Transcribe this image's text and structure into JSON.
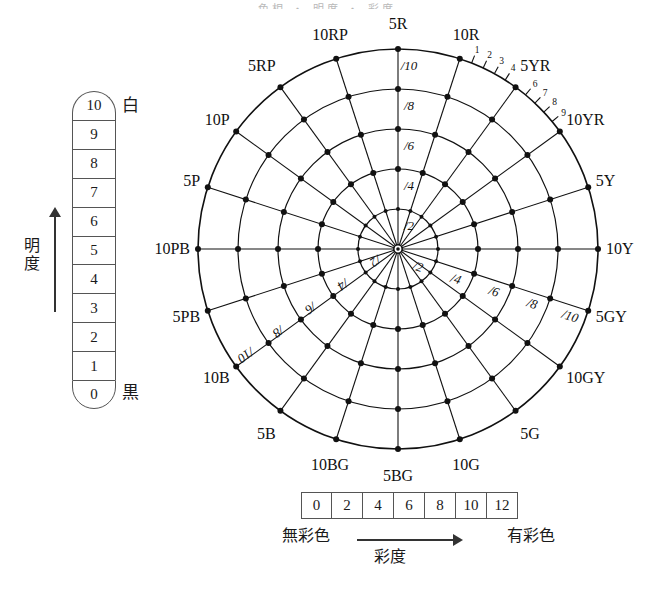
{
  "title_remnant": "色相 ・ 明度 ・ 彩度",
  "value_scale": {
    "axis_label": "明度",
    "top_label": "白",
    "bottom_label": "黒",
    "steps": [
      "10",
      "9",
      "8",
      "7",
      "6",
      "5",
      "4",
      "3",
      "2",
      "1",
      "0"
    ]
  },
  "chroma_scale": {
    "axis_label": "彩度",
    "left_label": "無彩色",
    "right_label": "有彩色",
    "steps": [
      "0",
      "2",
      "4",
      "6",
      "8",
      "10",
      "12"
    ]
  },
  "hue_circle": {
    "center": {
      "x": 398,
      "y": 249
    },
    "outer_radius": 200,
    "ring_count": 5,
    "hues": [
      {
        "label": "5R",
        "angle": -90
      },
      {
        "label": "10R",
        "angle": -72
      },
      {
        "label": "5YR",
        "angle": -54
      },
      {
        "label": "10YR",
        "angle": -36
      },
      {
        "label": "5Y",
        "angle": -18
      },
      {
        "label": "10Y",
        "angle": 0
      },
      {
        "label": "5GY",
        "angle": 18
      },
      {
        "label": "10GY",
        "angle": 36
      },
      {
        "label": "5G",
        "angle": 54
      },
      {
        "label": "10G",
        "angle": 72
      },
      {
        "label": "5BG",
        "angle": 90
      },
      {
        "label": "10BG",
        "angle": 108
      },
      {
        "label": "5B",
        "angle": 126
      },
      {
        "label": "10B",
        "angle": 144
      },
      {
        "label": "5PB",
        "angle": 162
      },
      {
        "label": "10PB",
        "angle": 180
      },
      {
        "label": "5P",
        "angle": 198
      },
      {
        "label": "10P",
        "angle": 216
      },
      {
        "label": "5RP",
        "angle": 234
      },
      {
        "label": "10RP",
        "angle": 252
      }
    ],
    "chroma_rings": [
      "/2",
      "/4",
      "/6",
      "/8",
      "/10"
    ],
    "chroma_label_axes": [
      {
        "axis_angle": -90,
        "labels": [
          "/2",
          "/4",
          "/6",
          "/8",
          "/10"
        ]
      },
      {
        "axis_angle": 18,
        "labels": [
          "/2",
          "/4",
          "/6",
          "/8",
          "/10"
        ]
      },
      {
        "axis_angle": 144,
        "labels": [
          "/2",
          "/4",
          "/6",
          "/8",
          "/10"
        ]
      }
    ],
    "outer_tick_numbers": [
      "1",
      "2",
      "3",
      "4",
      "6",
      "7",
      "8",
      "9"
    ],
    "outer_tick_range": {
      "from": "10R",
      "to": "10YR"
    }
  },
  "colors": {
    "ink": "#111111",
    "rule": "#555555",
    "background": "#ffffff"
  }
}
